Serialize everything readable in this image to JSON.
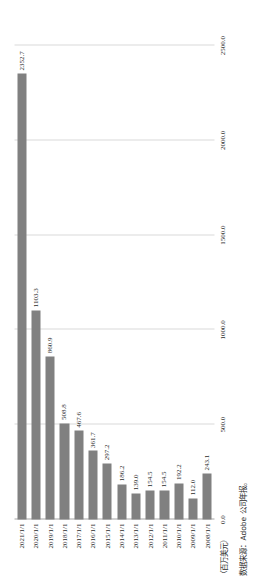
{
  "chart_data": {
    "type": "bar",
    "orientation": "horizontal",
    "title": "",
    "subtitle": "",
    "xlabel": "",
    "ylabel": "（百万美元）",
    "unit_label": "（百万美元）",
    "ylim": [
      0.0,
      2500.0
    ],
    "grid": true,
    "legend": null,
    "legend_position": "none",
    "bar_color": "#808080",
    "gridline_color": "#D9D9D9",
    "axis_color": "#A6A6A6",
    "categories": [
      "2008/1/1",
      "2009/1/1",
      "2010/1/1",
      "2011/1/1",
      "2012/1/1",
      "2013/1/1",
      "2014/1/1",
      "2015/1/1",
      "2016/1/1",
      "2017/1/1",
      "2018/1/1",
      "2019/1/1",
      "2020/1/1",
      "2021/1/1"
    ],
    "values": [
      243.1,
      112.0,
      192.2,
      154.5,
      154.5,
      139.0,
      186.2,
      297.2,
      361.7,
      467.6,
      508.8,
      860.9,
      1103.3,
      2352.7
    ],
    "value_labels": [
      "243.1",
      "112.0",
      "192.2",
      "154.5",
      "154.5",
      "139.0",
      "186.2",
      "297.2",
      "361.7",
      "467.6",
      "508.8",
      "860.9",
      "1103.3",
      "2352.7"
    ],
    "tick_values": [
      0.0,
      500.0,
      1000.0,
      1500.0,
      2000.0,
      2500.0
    ],
    "tick_labels": [
      "0.0",
      "500.0",
      "1000.0",
      "1500.0",
      "2000.0",
      "2500.0"
    ]
  },
  "footer": {
    "source_note": "数据来源：Adobe 公司年报。"
  }
}
